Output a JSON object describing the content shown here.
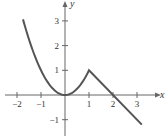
{
  "chart_data": {
    "type": "line",
    "title": "",
    "xlabel": "x",
    "ylabel": "y",
    "xlim": [
      -2,
      3.3
    ],
    "ylim": [
      -1.5,
      3.5
    ],
    "grid": false,
    "legend": null,
    "x_ticks": [
      -2,
      -1,
      1,
      2,
      3
    ],
    "y_ticks": [
      -1,
      1,
      2,
      3
    ],
    "x_tick_labels": [
      "−2",
      "−1",
      "1",
      "2",
      "3"
    ],
    "y_tick_labels": [
      "−1",
      "1",
      "2",
      "3"
    ],
    "series": [
      {
        "name": "f(x)",
        "description": "piecewise: x^2 for x <= 1, 2 - x for x >= 1",
        "x": [
          -1.75,
          -1.5,
          -1.25,
          -1,
          -0.75,
          -0.5,
          -0.25,
          0,
          0.25,
          0.5,
          0.75,
          1,
          1.5,
          2,
          2.5,
          3,
          3.2
        ],
        "y": [
          3.06,
          2.25,
          1.56,
          1,
          0.56,
          0.25,
          0.06,
          0,
          0.06,
          0.25,
          0.56,
          1,
          0.5,
          0,
          -0.5,
          -1,
          -1.2
        ]
      }
    ],
    "color": "#555555"
  },
  "axes": {
    "x_label": "x",
    "y_label": "y"
  }
}
